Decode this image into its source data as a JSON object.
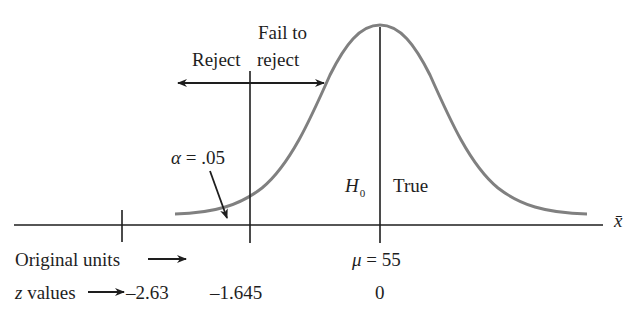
{
  "diagram": {
    "type": "one-tailed hypothesis test (left tail) normal curve",
    "labels": {
      "fail_to_line1": "Fail to",
      "fail_to_line2": "reject",
      "reject": "Reject",
      "alpha_symbol": "α",
      "alpha_eq": "= .05",
      "h0_symbol": "H",
      "h0_sub": "0",
      "true": "True",
      "x_axis": "x̄",
      "original_units": "Original units",
      "z_values": "z",
      "z_values_rest": "values",
      "mu_symbol": "μ",
      "mu_eq": "= 55"
    },
    "ticks_z": [
      "–2.63",
      "–1.645",
      "0"
    ],
    "colors": {
      "curve": "#808080",
      "lines": "#1e1e1e",
      "background": "#ffffff"
    }
  }
}
